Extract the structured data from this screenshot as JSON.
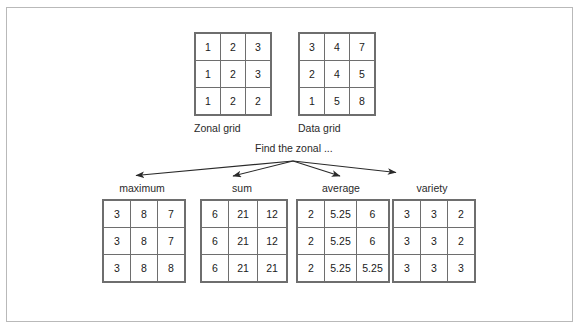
{
  "diagram": {
    "center_text": "Find the zonal ...",
    "source_grids": [
      {
        "name": "zonal-grid",
        "caption": "Zonal grid",
        "rows": [
          [
            "1",
            "2",
            "3"
          ],
          [
            "1",
            "2",
            "3"
          ],
          [
            "1",
            "2",
            "2"
          ]
        ]
      },
      {
        "name": "data-grid",
        "caption": "Data grid",
        "rows": [
          [
            "3",
            "4",
            "7"
          ],
          [
            "2",
            "4",
            "5"
          ],
          [
            "1",
            "5",
            "8"
          ]
        ]
      }
    ],
    "result_grids": [
      {
        "name": "maximum-grid",
        "label": "maximum",
        "rows": [
          [
            "3",
            "8",
            "7"
          ],
          [
            "3",
            "8",
            "7"
          ],
          [
            "3",
            "8",
            "8"
          ]
        ]
      },
      {
        "name": "sum-grid",
        "label": "sum",
        "rows": [
          [
            "6",
            "21",
            "12"
          ],
          [
            "6",
            "21",
            "12"
          ],
          [
            "6",
            "21",
            "21"
          ]
        ]
      },
      {
        "name": "average-grid",
        "label": "average",
        "rows": [
          [
            "2",
            "5.25",
            "6"
          ],
          [
            "2",
            "5.25",
            "6"
          ],
          [
            "2",
            "5.25",
            "5.25"
          ]
        ]
      },
      {
        "name": "variety-grid",
        "label": "variety",
        "rows": [
          [
            "3",
            "3",
            "2"
          ],
          [
            "3",
            "3",
            "2"
          ],
          [
            "3",
            "3",
            "3"
          ]
        ]
      }
    ],
    "colors": {
      "frame_border": "#b9b9b9",
      "cell_border": "#6e6e6e",
      "text": "#2a2a2a",
      "arrow": "#2a2a2a",
      "background": "#ffffff"
    }
  }
}
